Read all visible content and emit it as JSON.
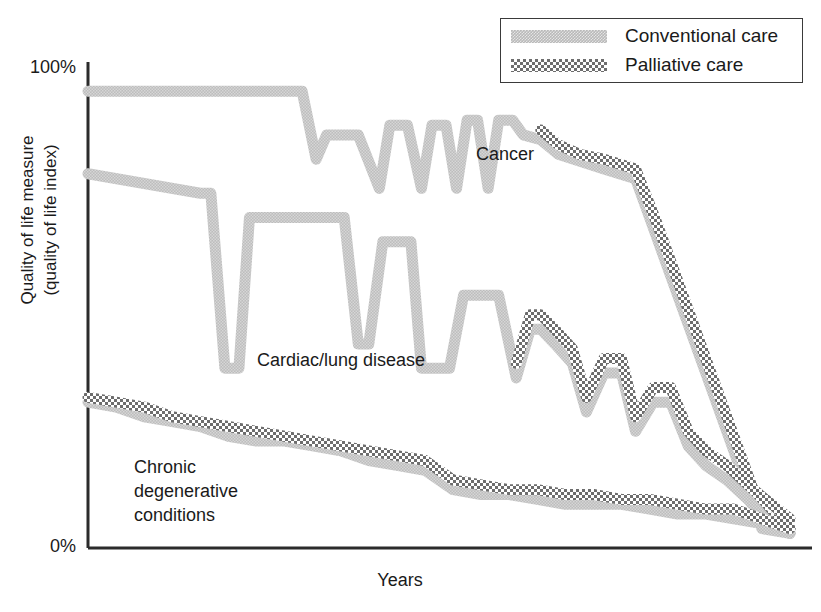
{
  "chart_data": {
    "type": "line",
    "title": "",
    "xlabel": "Years",
    "ylabel_line1": "Quality of life measure",
    "ylabel_line2": "(quality of life index)",
    "ylim": [
      0,
      100
    ],
    "ytick_labels": [
      "100%",
      "0%"
    ],
    "ytick_values": [
      100,
      0
    ],
    "xtick_labels": [],
    "grid": false,
    "legend_position": "top-right",
    "legend": [
      {
        "name": "Conventional care",
        "pattern": "solid-gray",
        "color": "#b9b9b9"
      },
      {
        "name": "Palliative care",
        "pattern": "checkered",
        "color": "#6e6e6e"
      }
    ],
    "annotations": [
      {
        "id": "cancer",
        "text": "Cancer"
      },
      {
        "id": "cardiac",
        "text": "Cardiac/lung disease"
      },
      {
        "id": "chronic",
        "text": "Chronic\ndegenerative\nconditions"
      }
    ],
    "series": [
      {
        "name": "Cancer — Conventional care",
        "group": "Cancer",
        "care": "Conventional care",
        "x": [
          0,
          22,
          30.5,
          32.5,
          34,
          36.5,
          38.5,
          41.5,
          43,
          45.5,
          47.5,
          49,
          51,
          52.5,
          54,
          55.5,
          57,
          58.5,
          60.5,
          62,
          64.5,
          67,
          73.5,
          78,
          81,
          85,
          89,
          92,
          94.5,
          96,
          100
        ],
        "values": [
          94,
          94,
          94,
          80,
          85,
          85,
          85,
          74,
          87,
          87,
          74,
          87,
          87,
          74,
          88,
          88,
          74,
          88,
          88,
          85,
          84,
          81,
          78,
          76,
          64,
          48,
          32,
          20,
          10,
          4,
          3
        ],
        "ylim": [
          0,
          100
        ]
      },
      {
        "name": "Cancer — Palliative care",
        "group": "Cancer",
        "care": "Palliative care",
        "x": [
          64.5,
          67,
          70,
          73.5,
          78,
          81,
          85,
          89,
          92,
          94.5,
          96,
          100
        ],
        "values": [
          86,
          83,
          81,
          80,
          78,
          67,
          51,
          35,
          23,
          13,
          7,
          4
        ],
        "ylim": [
          0,
          100
        ]
      },
      {
        "name": "Cardiac/lung disease — Conventional care",
        "group": "Cardiac/lung disease",
        "care": "Conventional care",
        "x": [
          0,
          16,
          17.5,
          19.5,
          21.5,
          23,
          35,
          36.5,
          38.5,
          40,
          42,
          43.5,
          46,
          47.5,
          51.5,
          53.5,
          56,
          58.5,
          61,
          63,
          64.5,
          66.5,
          69,
          71,
          73.5,
          76,
          78,
          80.5,
          83,
          85.5,
          88,
          91,
          94,
          96.5,
          100
        ],
        "values": [
          77,
          73,
          73,
          37,
          37,
          68,
          68,
          68,
          42,
          42,
          63,
          63,
          63,
          37,
          37,
          52,
          52,
          52,
          35,
          45,
          45,
          42,
          38,
          28,
          36,
          36,
          24,
          30,
          30,
          21,
          17,
          14,
          10,
          6,
          3
        ],
        "ylim": [
          0,
          100
        ]
      },
      {
        "name": "Cardiac/lung disease — Palliative care",
        "group": "Cardiac/lung disease",
        "care": "Palliative care",
        "x": [
          61,
          63,
          64.5,
          66.5,
          69,
          71,
          73.5,
          76,
          78,
          80.5,
          83,
          85.5,
          88,
          91,
          94,
          96.5,
          100
        ],
        "values": [
          38,
          48,
          48,
          45,
          41,
          31,
          39,
          39,
          27,
          33,
          33,
          24,
          20,
          17,
          13,
          10,
          6
        ],
        "ylim": [
          0,
          100
        ]
      },
      {
        "name": "Chronic degenerative conditions — Conventional care",
        "group": "Chronic degenerative conditions",
        "care": "Conventional care",
        "x": [
          0,
          4,
          8,
          12,
          16,
          20,
          24,
          28,
          32,
          36,
          40,
          44,
          48,
          52,
          56,
          60,
          64,
          68,
          72,
          76,
          80,
          84,
          88,
          92,
          96,
          100
        ],
        "values": [
          30,
          29,
          27,
          26,
          25,
          23,
          22,
          22,
          21,
          20,
          18,
          17,
          16,
          12,
          11,
          11,
          10,
          9,
          9,
          9,
          8,
          7,
          7,
          6,
          5,
          3
        ],
        "ylim": [
          0,
          100
        ]
      },
      {
        "name": "Chronic degenerative conditions — Palliative care",
        "group": "Chronic degenerative conditions",
        "care": "Palliative care",
        "x": [
          0,
          4,
          8,
          12,
          16,
          20,
          24,
          28,
          32,
          36,
          40,
          44,
          48,
          52,
          56,
          60,
          64,
          68,
          72,
          76,
          80,
          84,
          88,
          92,
          96,
          100
        ],
        "values": [
          31,
          30,
          29,
          27,
          26,
          25,
          24,
          23,
          22,
          21,
          20,
          19,
          18,
          14,
          13,
          12,
          12,
          11,
          11,
          10,
          10,
          9,
          8,
          8,
          6,
          4
        ],
        "ylim": [
          0,
          100
        ]
      }
    ]
  }
}
